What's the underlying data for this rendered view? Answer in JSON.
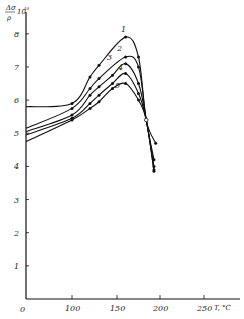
{
  "chart_data": {
    "type": "line",
    "title": "",
    "xlabel": "T, °C",
    "ylabel": "Δσ/ρ · 10^10",
    "x_ticks": [
      0,
      100,
      150,
      200,
      250
    ],
    "y_ticks": [
      1,
      2,
      3,
      4,
      5,
      6,
      7,
      8
    ],
    "xlim": [
      0,
      270
    ],
    "ylim": [
      0,
      8.5
    ],
    "grid": false,
    "legend": "inline curve numbers 1-5",
    "intersection_point": {
      "x": 184,
      "y": 5.4,
      "marker": "open-circle"
    },
    "series": [
      {
        "name": "1",
        "x": [
          0,
          100,
          120,
          130,
          160,
          175,
          184,
          195
        ],
        "values": [
          5.8,
          5.9,
          6.7,
          7.05,
          7.9,
          7.3,
          5.4,
          4.7
        ]
      },
      {
        "name": "2",
        "x": [
          0,
          100,
          120,
          130,
          160,
          175,
          184,
          193
        ],
        "values": [
          5.15,
          5.75,
          6.35,
          6.65,
          7.3,
          7.0,
          5.4,
          4.2
        ]
      },
      {
        "name": "3",
        "x": [
          0,
          100,
          120,
          130,
          145,
          160,
          175,
          184,
          193
        ],
        "values": [
          5.05,
          5.55,
          6.15,
          6.4,
          6.75,
          7.1,
          6.5,
          5.4,
          4.0
        ]
      },
      {
        "name": "4",
        "x": [
          0,
          100,
          120,
          130,
          145,
          160,
          175,
          184,
          193
        ],
        "values": [
          4.95,
          5.45,
          5.9,
          6.15,
          6.5,
          6.8,
          6.2,
          5.4,
          3.9
        ]
      },
      {
        "name": "5",
        "x": [
          0,
          100,
          120,
          130,
          145,
          160,
          175,
          184,
          193
        ],
        "values": [
          4.75,
          5.4,
          5.75,
          5.95,
          6.35,
          6.5,
          6.0,
          5.4,
          3.85
        ]
      }
    ]
  },
  "labels": {
    "ylabel_top": "Δσ",
    "ylabel_bottom": "ρ",
    "ylabel_exp": "10",
    "ylabel_exp_sup": "10",
    "xlabel": "T, °C",
    "origin": "0"
  }
}
